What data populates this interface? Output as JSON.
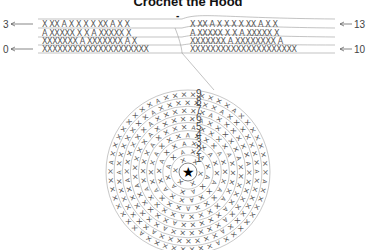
{
  "diagram": {
    "title": "Crochet the Hood",
    "flat_chart": {
      "left_labels": [
        {
          "text": "3",
          "row": 3
        },
        {
          "text": "0",
          "row": 0
        }
      ],
      "right_labels": [
        {
          "text": "13",
          "row": 13
        },
        {
          "text": "10",
          "row": 10
        }
      ],
      "rows": [
        {
          "left": "X XX A X X X X XX A X X",
          "right": "X XX A X X X X XX A X X"
        },
        {
          "left": "A XXXXX X X A XXXXX X",
          "right": "A XXXXX X X A XXXXX X"
        },
        {
          "left": "XXXXXXX A XXXXXXX A X",
          "right": "XXXXXXX A XXXXXXXX A"
        },
        {
          "left": "XXXXXXXXXXXXXXXXXXXXX",
          "right": "XXXXXXXXXXXXXXXXXXXXX"
        }
      ],
      "marker": "-"
    },
    "round_chart": {
      "center_symbol": "★",
      "round_labels": [
        "1",
        "2",
        "3",
        "4",
        "5",
        "6",
        "7",
        "8",
        "9"
      ],
      "rounds": 9
    },
    "legend_symbols": {
      "single_crochet": "X",
      "increase": "A",
      "magic_ring": "★"
    },
    "colors": {
      "line": "#9a9a9a",
      "stitch": "#555555",
      "text": "#111111"
    }
  }
}
